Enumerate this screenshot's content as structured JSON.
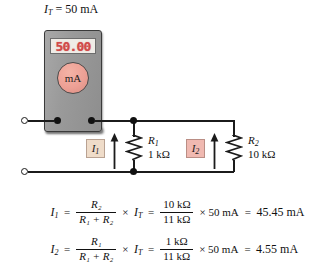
{
  "figure": {
    "title_prefix": "I",
    "title_sub": "T",
    "title_value": " = 50 mA"
  },
  "meter": {
    "display_value": "50.00",
    "dial_label": "mA",
    "terminal_left_name": "meter-terminal-left",
    "terminal_right_name": "meter-terminal-right"
  },
  "circuit": {
    "terminal_top_label": "",
    "terminal_bottom_label": "",
    "resistors": [
      {
        "id": "R1",
        "name": "R",
        "sub": "1",
        "value": "1 kΩ",
        "current_label": "I",
        "current_sub": "1",
        "box_color": "#efdcc9"
      },
      {
        "id": "R2",
        "name": "R",
        "sub": "2",
        "value": "10 kΩ",
        "current_label": "I",
        "current_sub": "2",
        "box_color": "#f0b9b1"
      }
    ]
  },
  "equations": [
    {
      "lhs": "I",
      "lhs_sub": "1",
      "eq1": "=",
      "frac1_num": "R₂",
      "frac1_den": "R₁ + R₂",
      "times1": "×",
      "it": "I",
      "it_sub": "T",
      "eq2": "=",
      "frac2_num": "10 kΩ",
      "frac2_den": "11 kΩ",
      "times2": "× 50 mA",
      "eq3": "=",
      "result": "45.45 mA"
    },
    {
      "lhs": "I",
      "lhs_sub": "2",
      "eq1": "=",
      "frac1_num": "R₁",
      "frac1_den": "R₁ + R₂",
      "times1": "×",
      "it": "I",
      "it_sub": "T",
      "eq2": "=",
      "frac2_num": "1 kΩ",
      "frac2_den": "11 kΩ",
      "times2": "× 50 mA",
      "eq3": "=",
      "result": "4.55 mA"
    }
  ],
  "colors": {
    "wire": "#1b1b1b",
    "meter_body": "#9a9a9a",
    "display_digits": "#d24a4a",
    "dial": "#eda095",
    "background": "#ffffff"
  }
}
